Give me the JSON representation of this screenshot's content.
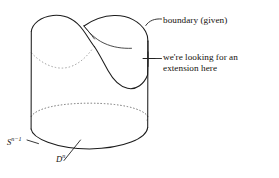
{
  "figure": {
    "kind": "mathematical-illustration",
    "background_color": "#ffffff",
    "ink_color": "#1c1c1c",
    "hidden_edge_color": "#6e6e6e"
  },
  "annotations": {
    "boundary": {
      "text": "boundary (given)",
      "leader": "curved-tick-to-top-rim"
    },
    "extension": {
      "line1": "we're looking for an",
      "line2": "extension here",
      "leader": "horizontal-line-to-cross-marker-on-right-wall"
    }
  },
  "labels": {
    "sphere": {
      "base": "S",
      "exponent": "n−1",
      "full": "S^{n-1}",
      "leader": "short-tick-to-bottom-rim-left"
    },
    "disk": {
      "base": "D",
      "exponent": "n",
      "full": "D^n",
      "leader": "slanted-tick-crossing-bottom-rim"
    }
  },
  "geometry": {
    "cylinder": {
      "left_wall_x": 31,
      "right_wall_x": 148,
      "top_y": 30,
      "bottom_y": 133
    },
    "bottom_ellipse": {
      "center_x": 89.5,
      "center_y": 133,
      "rx": 58.5,
      "ry": 16
    },
    "top_rim": "wavy saddle curve with left lobe peaking near x=62 and right lobe dipping near x=112"
  }
}
